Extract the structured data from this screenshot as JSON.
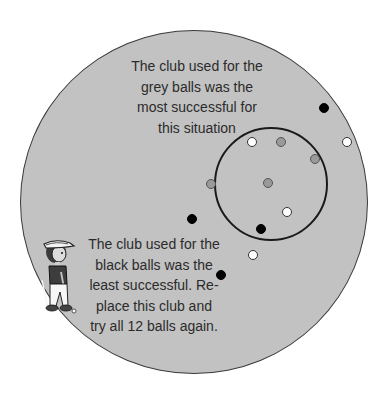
{
  "page": {
    "cutoff_text": "aaaa"
  },
  "diagram": {
    "type": "target-grouping",
    "field_color": "#c2c2c2",
    "ring": {
      "cx": 271,
      "cy": 184,
      "r": 57
    },
    "captions": {
      "top": {
        "lines": [
          "The club used for the",
          "grey balls was the",
          "most successful for",
          "this situation"
        ]
      },
      "bottom": {
        "lines": [
          "The club used for the",
          "black balls was the",
          "least successful. Re-",
          "place this club and",
          "try all 12 balls again."
        ]
      }
    },
    "balls": [
      {
        "color": "white",
        "x": 252,
        "y": 142
      },
      {
        "color": "grey",
        "x": 281,
        "y": 142
      },
      {
        "color": "grey",
        "x": 315,
        "y": 159
      },
      {
        "color": "grey",
        "x": 211,
        "y": 184
      },
      {
        "color": "grey",
        "x": 268,
        "y": 183
      },
      {
        "color": "white",
        "x": 287,
        "y": 212
      },
      {
        "color": "black",
        "x": 261,
        "y": 229
      },
      {
        "color": "black",
        "x": 324,
        "y": 108
      },
      {
        "color": "white",
        "x": 347,
        "y": 142
      },
      {
        "color": "black",
        "x": 192,
        "y": 219
      },
      {
        "color": "white",
        "x": 253,
        "y": 255
      },
      {
        "color": "black",
        "x": 221,
        "y": 275
      }
    ],
    "ball_count": 12,
    "icon": "golfer-icon"
  }
}
